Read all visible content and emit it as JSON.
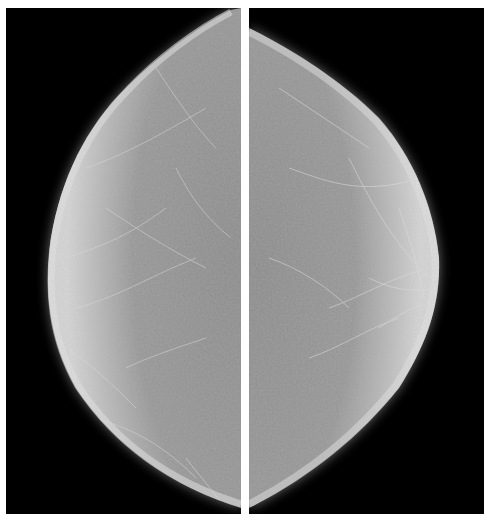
{
  "figure": {
    "background_color": "#ffffff",
    "panels": [
      {
        "id": "left",
        "view": "left-side mammogram",
        "tissue_side": "right edge of panel",
        "bounds": {
          "x": 6,
          "y": 8,
          "width": 235,
          "height": 506
        }
      },
      {
        "id": "right",
        "view": "right-side mammogram",
        "tissue_side": "left edge of panel",
        "bounds": {
          "x": 249,
          "y": 8,
          "width": 235,
          "height": 506
        }
      }
    ],
    "divider": {
      "x": 241,
      "width": 8,
      "color": "#ffffff"
    },
    "colors": {
      "panel_background": "#000000",
      "tissue_core": "#8c8c8c",
      "tissue_rim": "#d8d8d8"
    }
  }
}
